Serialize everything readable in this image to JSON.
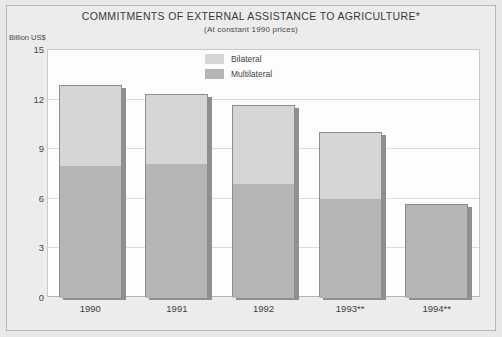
{
  "chart_data": {
    "type": "bar",
    "subtype": "stacked-vertical",
    "title": "COMMITMENTS OF EXTERNAL ASSISTANCE TO AGRICULTURE*",
    "subtitle": "(At constant 1990 prices)",
    "xlabel": "",
    "ylabel": "Billion US$",
    "categories": [
      "1990",
      "1991",
      "1992",
      "1993**",
      "1994**"
    ],
    "series": [
      {
        "name": "Multilateral",
        "color": "#b5b5b5",
        "values": [
          8.0,
          8.1,
          6.9,
          6.0,
          5.6
        ]
      },
      {
        "name": "Bilateral",
        "color": "#d6d6d6",
        "values": [
          4.8,
          4.2,
          4.7,
          4.0,
          0.0
        ]
      }
    ],
    "totals": [
      12.8,
      12.3,
      11.6,
      10.0,
      5.6
    ],
    "yticks": [
      15,
      12,
      9,
      6,
      3,
      0
    ],
    "ylim": [
      0,
      15
    ],
    "grid": true,
    "legend_position": "inside-top-center",
    "legend": [
      "Bilateral",
      "Multilateral"
    ],
    "plot_background": "#fdfdfd",
    "figure_background": "#ececec"
  },
  "legend": {
    "items": [
      {
        "label": "Bilateral",
        "color": "#d6d6d6",
        "icon": "legend-swatch"
      },
      {
        "label": "Multilateral",
        "color": "#b5b5b5",
        "icon": "legend-swatch"
      }
    ]
  }
}
